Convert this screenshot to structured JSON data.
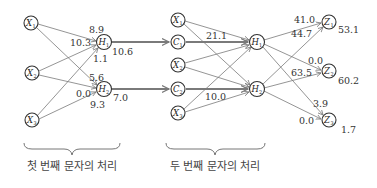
{
  "diagram": {
    "stage1": {
      "inputs": [
        {
          "id": "X1",
          "letter": "X",
          "sub": "1"
        },
        {
          "id": "X2",
          "letter": "X",
          "sub": "2"
        },
        {
          "id": "X3",
          "letter": "X",
          "sub": "3"
        }
      ],
      "hidden": [
        {
          "id": "H1",
          "letter": "H",
          "sub": "1",
          "output": "10.6"
        },
        {
          "id": "H2",
          "letter": "H",
          "sub": "2",
          "output": "7.0"
        }
      ],
      "weights_into_H1": {
        "top": "8.9",
        "left": "10.3",
        "bottom": "1.1"
      },
      "weights_into_H2": {
        "top": "5.6",
        "left": "0.0",
        "bottom": "9.3"
      },
      "caption": "첫 번째 문자의 처리"
    },
    "stage2": {
      "inputs": [
        {
          "id": "X1",
          "letter": "X",
          "sub": "1"
        },
        {
          "id": "C1",
          "letter": "C",
          "sub": "1"
        },
        {
          "id": "X2",
          "letter": "X",
          "sub": "2"
        },
        {
          "id": "C2",
          "letter": "C",
          "sub": "2"
        },
        {
          "id": "X3",
          "letter": "X",
          "sub": "3"
        }
      ],
      "hidden": [
        {
          "id": "H1",
          "letter": "H",
          "sub": "1"
        },
        {
          "id": "H2",
          "letter": "H",
          "sub": "2"
        }
      ],
      "context_weights": {
        "C1_to_H1": "21.1",
        "C2_to_H2": "10.0"
      },
      "outputs": [
        {
          "id": "Z1",
          "letter": "Z",
          "sub": "1",
          "value": "53.1"
        },
        {
          "id": "Z2",
          "letter": "Z",
          "sub": "2",
          "value": "60.2"
        },
        {
          "id": "Z3",
          "letter": "Z",
          "sub": "3",
          "value": "1.7"
        }
      ],
      "weights_into_Z1": {
        "top": "41.0",
        "bottom": "44.7"
      },
      "weights_into_Z2": {
        "top": "0.0",
        "bottom": "63.5"
      },
      "weights_into_Z3": {
        "top": "3.9",
        "bottom": "0.0"
      },
      "caption": "두 번째 문자의 처리"
    }
  }
}
